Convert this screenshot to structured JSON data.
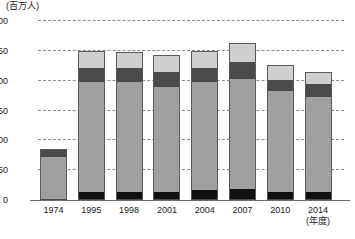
{
  "chart_data": {
    "type": "bar",
    "stacked": true,
    "title": "",
    "subtitle": "",
    "xlabel": "(年度)",
    "ylabel": "(百万人)",
    "unit_caption": "(百万人)",
    "categories": [
      "1974",
      "1995",
      "1998",
      "2001",
      "2004",
      "2007",
      "2010",
      "2014"
    ],
    "ylim": [
      0,
      300
    ],
    "yticks": [
      0,
      50,
      100,
      150,
      200,
      250,
      300
    ],
    "ytick_labels": [
      "0",
      "50",
      "100",
      "150",
      "200",
      "250",
      "300"
    ],
    "grid": true,
    "grid_style": "dashed-horizontal",
    "legend": "none",
    "series": [
      {
        "name": "bottom-black-segment",
        "color": "#101010",
        "values": [
          0,
          13,
          13,
          13,
          16,
          18,
          13,
          13
        ]
      },
      {
        "name": "main-mid-gray-segment",
        "color": "#a0a0a0",
        "values": [
          72,
          185,
          185,
          177,
          181,
          184,
          170,
          159
        ]
      },
      {
        "name": "dark-gray-segment",
        "color": "#4a4a4a",
        "values": [
          14,
          23,
          24,
          24,
          24,
          30,
          18,
          22
        ]
      },
      {
        "name": "light-gray-segment",
        "color": "#cfcfcf",
        "values": [
          0,
          29,
          26,
          29,
          29,
          31,
          25,
          20
        ]
      }
    ],
    "totals": [
      86,
      250,
      248,
      243,
      250,
      263,
      226,
      214
    ]
  },
  "colors": {
    "light_gray": "#cfcfcf",
    "dark_gray": "#4a4a4a",
    "mid_gray": "#a0a0a0",
    "black": "#101010",
    "gridline": "#8d8d8d",
    "axis": "#6d6d6d",
    "text": "#1a1a1a",
    "background": "#ffffff"
  }
}
